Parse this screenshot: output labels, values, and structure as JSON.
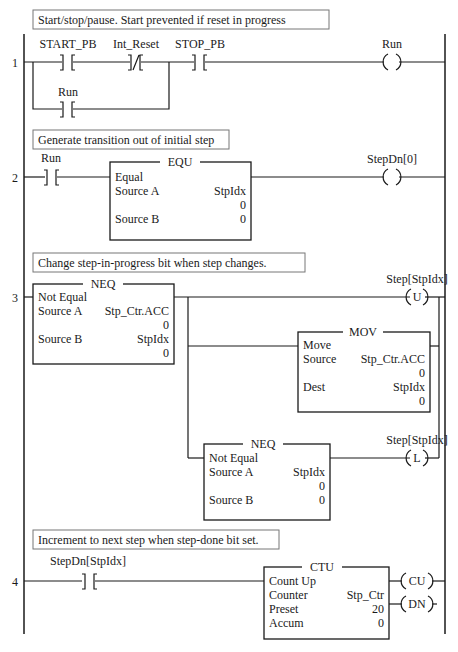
{
  "rungs": [
    {
      "number": "1",
      "comment": "Start/stop/pause. Start prevented if reset in progress",
      "contacts": [
        {
          "tag": "START_PB",
          "type": "XIC"
        },
        {
          "tag": "Int_Reset",
          "type": "XIO"
        },
        {
          "tag": "STOP_PB",
          "type": "XIC"
        },
        {
          "tag": "Run",
          "type": "XIC",
          "branch": true
        }
      ],
      "coil": {
        "tag": "Run",
        "type": "OTE",
        "symbol": ""
      }
    },
    {
      "number": "2",
      "comment": "Generate transition out of initial step",
      "contact": {
        "tag": "Run",
        "type": "XIC"
      },
      "block": {
        "name": "EQU",
        "title": "Equal",
        "rows": [
          {
            "label": "Source A",
            "value": "StpIdx"
          },
          {
            "label": "",
            "value": "0"
          },
          {
            "label": "Source B",
            "value": "0"
          }
        ]
      },
      "coil": {
        "tag": "StepDn[0]",
        "type": "OTE",
        "symbol": ""
      }
    },
    {
      "number": "3",
      "comment": "Change step-in-progress bit when step changes.",
      "block": {
        "name": "NEQ",
        "title": "Not Equal",
        "rows": [
          {
            "label": "Source A",
            "value": "Stp_Ctr.ACC"
          },
          {
            "label": "",
            "value": "0"
          },
          {
            "label": "Source B",
            "value": "StpIdx"
          },
          {
            "label": "",
            "value": "0"
          }
        ]
      },
      "unlatch_coil": {
        "tag": "Step[StpIdx]",
        "type": "OTU",
        "symbol": "U"
      },
      "mov_block": {
        "name": "MOV",
        "title": "Move",
        "rows": [
          {
            "label": "Source",
            "value": "Stp_Ctr.ACC"
          },
          {
            "label": "",
            "value": "0"
          },
          {
            "label": "Dest",
            "value": "StpIdx"
          },
          {
            "label": "",
            "value": "0"
          }
        ]
      },
      "neq_block2": {
        "name": "NEQ",
        "title": "Not Equal",
        "rows": [
          {
            "label": "Source A",
            "value": "StpIdx"
          },
          {
            "label": "",
            "value": "0"
          },
          {
            "label": "Source B",
            "value": "0"
          }
        ]
      },
      "latch_coil": {
        "tag": "Step[StpIdx]",
        "type": "OTL",
        "symbol": "L"
      }
    },
    {
      "number": "4",
      "comment": "Increment to next step when step-done bit set.",
      "contact": {
        "tag": "StepDn[StpIdx]",
        "type": "XIC"
      },
      "block": {
        "name": "CTU",
        "title": "Count Up",
        "rows": [
          {
            "label": "Counter",
            "value": "Stp_Ctr"
          },
          {
            "label": "Preset",
            "value": "20"
          },
          {
            "label": "Accum",
            "value": "0"
          }
        ]
      },
      "outputs": [
        {
          "symbol": "CU"
        },
        {
          "symbol": "DN"
        }
      ]
    }
  ]
}
